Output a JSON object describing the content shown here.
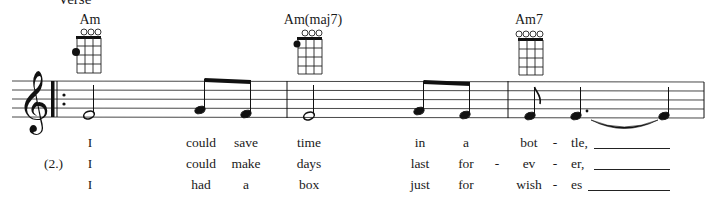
{
  "section": {
    "label": "Verse"
  },
  "chords": [
    {
      "name": "Am",
      "x": 90,
      "open_strings": [
        false,
        true,
        true,
        true
      ],
      "dots": [
        {
          "string": 0,
          "fret": 2
        }
      ]
    },
    {
      "name": "Am(maj7)",
      "x": 308,
      "open_strings": [
        false,
        true,
        true,
        true
      ],
      "dots": [
        {
          "string": 0,
          "fret": 1
        }
      ]
    },
    {
      "name": "Am7",
      "x": 529,
      "open_strings": [
        true,
        true,
        true,
        true
      ],
      "dots": []
    }
  ],
  "staff": {
    "clef": "treble",
    "repeat_start": true,
    "measures": [
      {
        "notes": [
          {
            "pitch": "E4",
            "duration": "half"
          },
          {
            "pitch": "F4",
            "duration": "eighth",
            "beam": "start"
          },
          {
            "pitch": "E4",
            "duration": "eighth",
            "beam": "end"
          }
        ]
      },
      {
        "notes": [
          {
            "pitch": "E4",
            "duration": "half"
          },
          {
            "pitch": "F4",
            "duration": "eighth",
            "beam": "start"
          },
          {
            "pitch": "E4",
            "duration": "eighth",
            "beam": "end"
          }
        ]
      },
      {
        "notes": [
          {
            "pitch": "E4",
            "duration": "eighth"
          },
          {
            "pitch": "E4",
            "duration": "dotted-quarter",
            "tie": "start"
          },
          {
            "pitch": "E4",
            "duration": "quarter",
            "tie": "end"
          }
        ]
      }
    ]
  },
  "lyrics": {
    "verse_number": "(2.)",
    "columns_x": [
      98,
      201,
      246,
      309,
      423,
      466,
      519,
      553,
      588
    ],
    "lines": [
      [
        "I",
        "could",
        "save",
        "time",
        "in",
        "a",
        "",
        "bot",
        "-",
        "tle,"
      ],
      [
        "I",
        "could",
        "make",
        "days",
        "last",
        "for",
        "-",
        "ev",
        "-",
        "er,"
      ],
      [
        "I",
        "had",
        "a",
        "box",
        "just",
        "for",
        "",
        "wish",
        "-",
        "es"
      ]
    ]
  }
}
